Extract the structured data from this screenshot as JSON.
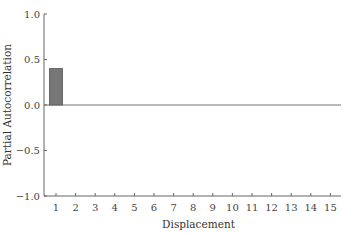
{
  "chart_data": {
    "type": "bar",
    "title": "",
    "xlabel": "Displacement",
    "ylabel": "Partial Autocorrelation",
    "categories": [
      "1",
      "2",
      "3",
      "4",
      "5",
      "6",
      "7",
      "8",
      "9",
      "10",
      "11",
      "12",
      "13",
      "14",
      "15"
    ],
    "values": [
      0.4,
      0,
      0,
      0,
      0,
      0,
      0,
      0,
      0,
      0,
      0,
      0,
      0,
      0,
      0
    ],
    "ylim": [
      -1.0,
      1.0
    ],
    "yticks": [
      "1.0",
      "0.5",
      "0.0",
      "-0.5",
      "-1.0"
    ],
    "yticks_values": [
      1.0,
      0.5,
      0.0,
      -0.5,
      -1.0
    ],
    "grid": false,
    "bar_color": "#777777"
  }
}
